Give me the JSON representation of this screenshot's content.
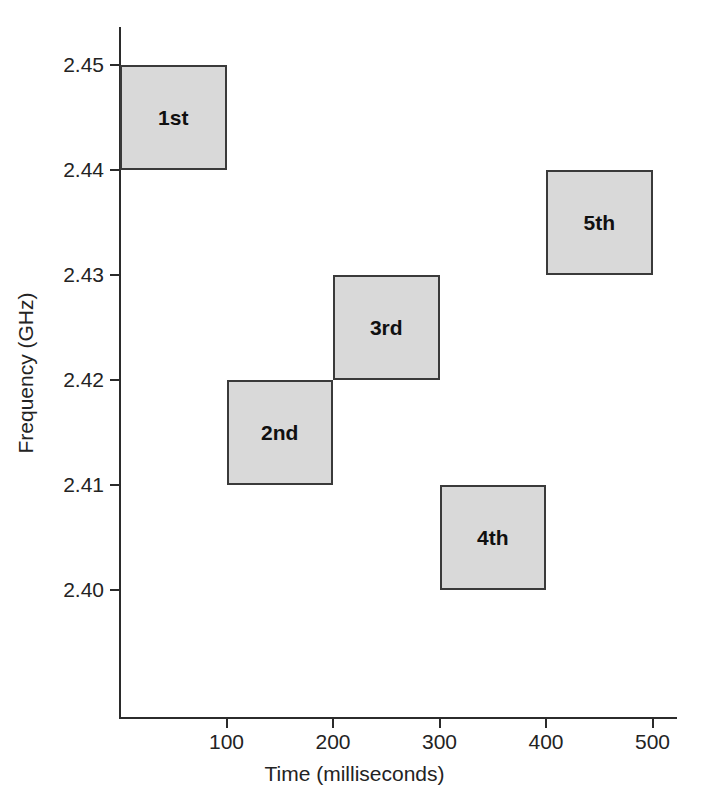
{
  "chart_data": {
    "type": "bar",
    "title": "",
    "subtitle": "",
    "xlabel": "Time (milliseconds)",
    "ylabel": "Frequency (GHz)",
    "xlim": [
      0,
      530
    ],
    "ylim": [
      2.3935,
      2.4565
    ],
    "xticks": [
      100,
      200,
      300,
      400,
      500
    ],
    "xtick_labels": [
      "100",
      "200",
      "300",
      "400",
      "500"
    ],
    "yticks": [
      2.4,
      2.41,
      2.42,
      2.43,
      2.44,
      2.45
    ],
    "ytick_labels": [
      "2.40",
      "2.41",
      "2.42",
      "2.43",
      "2.44",
      "2.45"
    ],
    "grid": false,
    "legend": null,
    "blocks": [
      {
        "label": "1st",
        "t_start": 0,
        "t_end": 100,
        "f_low": 2.44,
        "f_high": 2.45,
        "fill": "#d9d9d9",
        "stroke": "#3a3a3a"
      },
      {
        "label": "2nd",
        "t_start": 100,
        "t_end": 200,
        "f_low": 2.41,
        "f_high": 2.42,
        "fill": "#d9d9d9",
        "stroke": "#3a3a3a"
      },
      {
        "label": "3rd",
        "t_start": 200,
        "t_end": 300,
        "f_low": 2.42,
        "f_high": 2.43,
        "fill": "#d9d9d9",
        "stroke": "#3a3a3a"
      },
      {
        "label": "4th",
        "t_start": 300,
        "t_end": 400,
        "f_low": 2.4,
        "f_high": 2.41,
        "fill": "#d9d9d9",
        "stroke": "#3a3a3a"
      },
      {
        "label": "5th",
        "t_start": 400,
        "t_end": 500,
        "f_low": 2.43,
        "f_high": 2.44,
        "fill": "#d9d9d9",
        "stroke": "#3a3a3a"
      }
    ]
  },
  "axes": {
    "x_title": "Time (milliseconds)",
    "y_title": "Frequency (GHz)",
    "axis_color": "#2b2b2b"
  }
}
